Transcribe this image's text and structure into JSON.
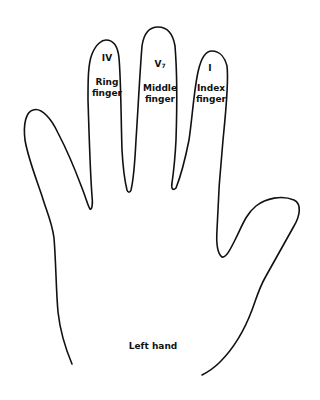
{
  "diagram": {
    "title": "Left hand",
    "stroke_color": "#111111",
    "background": "#ffffff",
    "fingers": [
      {
        "id": "ring",
        "numeral": "IV",
        "numeral_sub": "",
        "line1": "Ring",
        "line2": "finger"
      },
      {
        "id": "middle",
        "numeral": "V",
        "numeral_sub": "7",
        "line1": "Middle",
        "line2": "finger"
      },
      {
        "id": "index",
        "numeral": "I",
        "numeral_sub": "",
        "line1": "Index",
        "line2": "finger"
      }
    ]
  }
}
